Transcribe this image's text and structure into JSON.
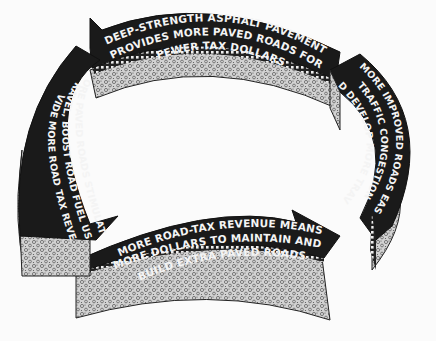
{
  "diagram": {
    "type": "cycle",
    "direction": "clockwise",
    "colors": {
      "background": "#fbfbfb",
      "arrow_top": "#1a1a1a",
      "arrow_text": "#f4f4f4",
      "aggregate_side": "#c9c9c9",
      "binder_band": "#2a2a2a"
    },
    "segments": [
      {
        "position": "top",
        "lines": [
          "DEEP-STRENGTH ASPHALT PAVEMENT",
          "PROVIDES MORE PAVED ROADS FOR",
          "FEWER TAX DOLLARS"
        ]
      },
      {
        "position": "right",
        "lines": [
          "MORE IMPROVED ROADS EASE",
          "TRAFFIC CONGESTION",
          "AND DEVELOP MORE TRAVEL"
        ]
      },
      {
        "position": "bottom",
        "lines": [
          "MORE ROAD-TAX REVENUE MEANS",
          "MORE DOLLARS TO MAINTAIN AND",
          "BUILD EXTRA PAVED ROADS"
        ]
      },
      {
        "position": "left",
        "lines": [
          "MORE PAVED ROADS STIMULATE",
          "TRAVEL, BOOST ROAD FUEL USE",
          "PROVIDE MORE ROAD TAX REVENUE"
        ]
      }
    ]
  }
}
